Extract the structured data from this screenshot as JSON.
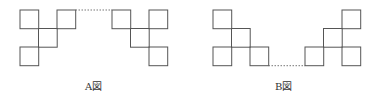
{
  "colors": {
    "line": "#555555",
    "dash": "#777777",
    "text": "#333333"
  },
  "square_size": 18.7,
  "figures": [
    {
      "id": "A",
      "label": "A図",
      "label_x": 85,
      "groups": [
        {
          "name": "left-group",
          "squares": [
            [
              20,
              10
            ],
            [
              57,
              10
            ],
            [
              38.5,
              28.5
            ],
            [
              20,
              47
            ]
          ]
        },
        {
          "name": "right-group",
          "squares": [
            [
              112,
              10
            ],
            [
              149,
              10
            ],
            [
              130.5,
              28.5
            ],
            [
              149,
              47
            ]
          ]
        }
      ],
      "dashed": {
        "x1": 75.5,
        "y1": 10,
        "x2": 112,
        "y2": 10
      }
    },
    {
      "id": "B",
      "label": "B図",
      "label_x": 275,
      "groups": [
        {
          "name": "left-group",
          "squares": [
            [
              213,
              10
            ],
            [
              231.5,
              28.5
            ],
            [
              213,
              47
            ],
            [
              250,
              47
            ]
          ]
        },
        {
          "name": "right-group",
          "squares": [
            [
              342,
              10
            ],
            [
              323.5,
              28.5
            ],
            [
              305,
              47
            ],
            [
              342,
              47
            ]
          ]
        }
      ],
      "dashed": {
        "x1": 268.5,
        "y1": 65.7,
        "x2": 305,
        "y2": 65.7
      }
    }
  ]
}
